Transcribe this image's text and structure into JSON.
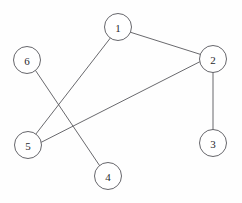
{
  "figure": {
    "type": "node-link-graph",
    "background_color": "#fefefe",
    "width": 242,
    "height": 203,
    "node_fill_color": "#ffffff",
    "node_stroke_color": "#55555a",
    "edge_color": "#58585c",
    "label_color": "#2a2a2e"
  },
  "nodes": [
    {
      "id": "1",
      "label": "1",
      "cx": 118,
      "cy": 27,
      "r": 13.5
    },
    {
      "id": "2",
      "label": "2",
      "cx": 213,
      "cy": 59,
      "r": 13.5
    },
    {
      "id": "3",
      "label": "3",
      "cx": 213,
      "cy": 143,
      "r": 13.5
    },
    {
      "id": "4",
      "label": "4",
      "cx": 108,
      "cy": 176,
      "r": 13.5
    },
    {
      "id": "5",
      "label": "5",
      "cx": 28,
      "cy": 145,
      "r": 13.5
    },
    {
      "id": "6",
      "label": "6",
      "cx": 27,
      "cy": 60,
      "r": 13.5
    }
  ],
  "edges": [
    {
      "source": "1",
      "target": "2",
      "x1": 130.3,
      "y1": 32.2,
      "x2": 200.8,
      "y2": 54.5
    },
    {
      "source": "1",
      "target": "5",
      "x1": 110.3,
      "y1": 38.1,
      "x2": 35.9,
      "y2": 134.0
    },
    {
      "source": "2",
      "target": "3",
      "x1": 213.0,
      "y1": 72.5,
      "x2": 213.0,
      "y2": 129.5
    },
    {
      "source": "2",
      "target": "5",
      "x1": 199.7,
      "y1": 61.8,
      "x2": 41.4,
      "y2": 142.2
    },
    {
      "source": "4",
      "target": "6",
      "x1": 99.6,
      "y1": 165.6,
      "x2": 35.6,
      "y2": 70.6
    }
  ]
}
